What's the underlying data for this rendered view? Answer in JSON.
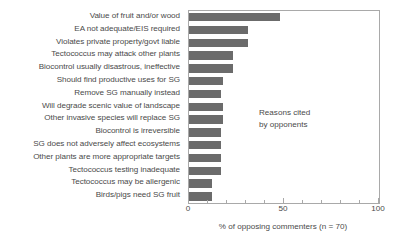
{
  "chart_data": {
    "type": "bar",
    "orientation": "horizontal",
    "title": "",
    "xlabel": "% of opposing commenters (n = 70)",
    "ylabel": "",
    "xlim": [
      0,
      100
    ],
    "xticks": [
      0,
      50,
      100
    ],
    "xtick_labels": [
      "0",
      "50",
      "100"
    ],
    "minor_tick_interval": 10,
    "grid": false,
    "legend": false,
    "bar_color": "#6b6b6b",
    "annotations": [
      {
        "text_line1": "Reasons cited",
        "text_line2": "by opponents"
      }
    ],
    "categories": [
      "Value of fruit and/or wood",
      "EA not adequate/EIS required",
      "Violates private property/govt liable",
      "Tectococcus may attack other plants",
      "Biocontrol usually disastrous, ineffective",
      "Should find productive uses for SG",
      "Remove SG manually instead",
      "Will degrade scenic value of landscape",
      "Other invasive species will replace SG",
      "Biocontrol is irreversible",
      "SG does not adversely affect ecosystems",
      "Other plants are more appropriate targets",
      "Tectococcus testing inadequate",
      "Tectococcus may be allergenic",
      "Birds/pigs need SG fruit"
    ],
    "values": [
      48,
      31,
      31,
      23,
      23,
      18,
      17,
      18,
      18,
      17,
      17,
      17,
      17,
      12,
      12
    ]
  }
}
